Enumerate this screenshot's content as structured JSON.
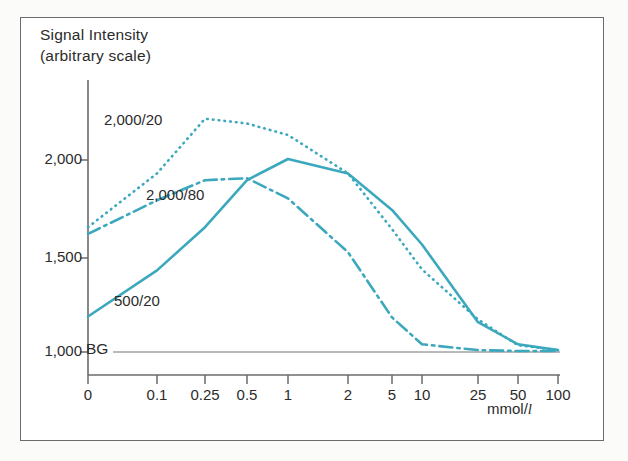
{
  "figure": {
    "background_color": "#ffffff",
    "frame_color": "#6b6b6b",
    "accent_color": "#3ba8bd",
    "text_color": "#2b2b2b"
  },
  "axis_titles": {
    "y_line1": "Signal Intensity",
    "y_line2": "(arbitrary scale)",
    "x_unit_text": "mmol/",
    "x_unit_italic": "l"
  },
  "y_ticks": [
    {
      "label": "2,000",
      "value": 2000,
      "y_px": 160
    },
    {
      "label": "1,500",
      "value": 1500,
      "y_px": 258
    },
    {
      "label": "1,000",
      "value": 1000,
      "y_px": 352
    }
  ],
  "x_ticks": [
    {
      "label": "0",
      "value": 0,
      "x_px": 88
    },
    {
      "label": "0.1",
      "value": 0.1,
      "x_px": 157
    },
    {
      "label": "0.25",
      "value": 0.25,
      "x_px": 205
    },
    {
      "label": "0.5",
      "value": 0.5,
      "x_px": 247
    },
    {
      "label": "1",
      "value": 1,
      "x_px": 288
    },
    {
      "label": "2",
      "value": 2,
      "x_px": 348
    },
    {
      "label": "5",
      "value": 5,
      "x_px": 392
    },
    {
      "label": "10",
      "value": 10,
      "x_px": 422
    },
    {
      "label": "25",
      "value": 25,
      "x_px": 478
    },
    {
      "label": "50",
      "value": 50,
      "x_px": 518
    },
    {
      "label": "100",
      "value": 100,
      "x_px": 558
    }
  ],
  "baseline": {
    "label": "BG",
    "value": 1000,
    "color": "#777777"
  },
  "series_labels": {
    "a": "2,000/20",
    "b": "2,000/80",
    "c": "500/20"
  },
  "chart_data": {
    "type": "line",
    "title": "",
    "xlabel": "mmol/l",
    "ylabel": "Signal Intensity (arbitrary scale)",
    "x_scale": "ordinal-log-like",
    "categories": [
      "0",
      "0.1",
      "0.25",
      "0.5",
      "1",
      "2",
      "5",
      "10",
      "25",
      "50",
      "100"
    ],
    "x": [
      0,
      0.1,
      0.25,
      0.5,
      1,
      2,
      5,
      10,
      25,
      50,
      100
    ],
    "ylim": [
      950,
      2300
    ],
    "xlim": [
      0,
      100
    ],
    "grid": false,
    "legend": "inline-annotations",
    "reference_lines": [
      {
        "name": "BG",
        "value": 1000,
        "label": "BG",
        "style": "solid-thin",
        "color": "#777777"
      }
    ],
    "series": [
      {
        "name": "2,000/20",
        "style": "dotted",
        "color": "#3ba8bd",
        "values": [
          1650,
          1930,
          2215,
          2190,
          2130,
          1930,
          1640,
          1430,
          1170,
          1035,
          1010
        ]
      },
      {
        "name": "2,000/80",
        "style": "dash-dot",
        "color": "#3ba8bd",
        "values": [
          1615,
          1790,
          1895,
          1905,
          1800,
          1520,
          1180,
          1040,
          1010,
          1005,
          1005
        ]
      },
      {
        "name": "500/20",
        "style": "solid",
        "color": "#3ba8bd",
        "values": [
          1185,
          1425,
          1650,
          1895,
          2005,
          1930,
          1740,
          1560,
          1155,
          1040,
          1010
        ]
      }
    ]
  }
}
